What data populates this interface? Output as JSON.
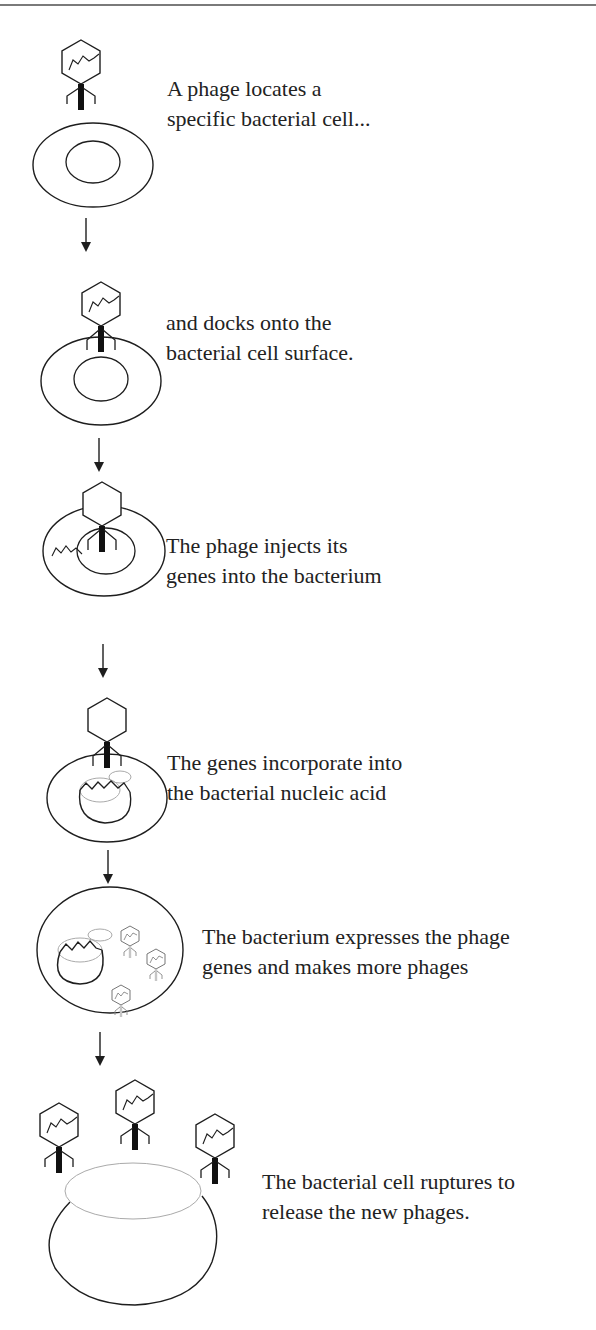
{
  "figure": {
    "colors": {
      "stroke": "#1e1e1e",
      "tail": "#111111",
      "faded": "#a8a8a8",
      "background": "#ffffff"
    },
    "steps": [
      {
        "index": 1,
        "icon": "phage-approaching-cell",
        "lines": [
          "A phage locates a",
          "specific bacterial cell..."
        ]
      },
      {
        "index": 2,
        "icon": "phage-docked-on-cell",
        "lines": [
          "and docks onto the",
          "bacterial cell surface."
        ]
      },
      {
        "index": 3,
        "icon": "phage-injecting-genes",
        "lines": [
          "The phage injects its",
          "genes into the bacterium"
        ]
      },
      {
        "index": 4,
        "icon": "genes-incorporating-into-nucleoid",
        "lines": [
          "The genes incorporate into",
          "the bacterial nucleic acid"
        ]
      },
      {
        "index": 5,
        "icon": "cell-producing-phages",
        "lines": [
          "The bacterium expresses the phage",
          "genes and makes more phages"
        ]
      },
      {
        "index": 6,
        "icon": "cell-rupturing-releasing-phages",
        "lines": [
          "The bacterial cell ruptures to",
          "release the new phages."
        ]
      }
    ],
    "arrow_icon": "down-arrow-icon",
    "arrow_count": 5
  }
}
